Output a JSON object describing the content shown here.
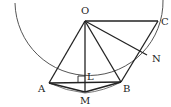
{
  "diagram": {
    "type": "geometry",
    "circle": {
      "center": "O",
      "cx": 85,
      "cy": 21,
      "r": 72,
      "arc_start": [
        15,
        3
      ],
      "arc_end": [
        163,
        0
      ]
    },
    "points": {
      "O": {
        "x": 85,
        "y": 21,
        "label": "O",
        "lx": 81,
        "ly": 14
      },
      "C": {
        "x": 158,
        "y": 21,
        "label": "C",
        "lx": 161,
        "ly": 25
      },
      "N": {
        "x": 147,
        "y": 55,
        "label": "N",
        "lx": 152,
        "ly": 62
      },
      "A": {
        "x": 49,
        "y": 83,
        "label": "A",
        "lx": 38,
        "ly": 92
      },
      "B": {
        "x": 121,
        "y": 82,
        "label": "B",
        "lx": 123,
        "ly": 92
      },
      "L": {
        "x": 85,
        "y": 83,
        "label": "L",
        "lx": 87,
        "ly": 80
      },
      "M": {
        "x": 85,
        "y": 92,
        "label": "M",
        "lx": 80,
        "ly": 104
      }
    },
    "segments": [
      [
        "O",
        "C"
      ],
      [
        "O",
        "A"
      ],
      [
        "O",
        "B"
      ],
      [
        "O",
        "M"
      ],
      [
        "O",
        "N"
      ],
      [
        "A",
        "B"
      ],
      [
        "A",
        "M"
      ],
      [
        "M",
        "B"
      ],
      [
        "B",
        "C"
      ]
    ],
    "right_angle": {
      "at": "L",
      "size": 7
    },
    "colors": {
      "stroke": "#222222",
      "arc": "#555555",
      "background": "#ffffff"
    }
  }
}
